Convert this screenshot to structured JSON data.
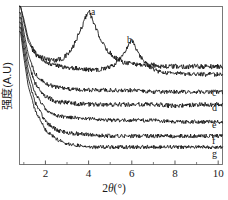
{
  "figure": {
    "background_color": "#ffffff",
    "frame_color": "#4a4a4a",
    "curve_color": "#111111"
  },
  "axes": {
    "x_title_prefix": "2",
    "x_title_symbol": "θ",
    "x_title_suffix": "(°)",
    "y_title": "强度(A.U)",
    "x_ticklabels": [
      "2",
      "4",
      "6",
      "8",
      "10"
    ],
    "x_tickvalues": [
      2,
      4,
      6,
      8,
      10
    ],
    "x_minor_tickvalues": [
      1,
      3,
      5,
      7,
      9
    ],
    "y_ticklabels": []
  },
  "annotations": {
    "peak_a": "a",
    "peak_b": "b"
  },
  "curve_labels": {
    "c": "c",
    "d": "d",
    "e": "e",
    "f": "f",
    "g": "g"
  },
  "chart_data": {
    "type": "line",
    "title": "",
    "xlabel": "2θ(°)",
    "ylabel": "强度(A.U)",
    "xlim": [
      0.8,
      10.2
    ],
    "ylim": [
      0,
      100
    ],
    "grid": false,
    "legend": "inline-right-labels",
    "annotations": [
      {
        "text": "a",
        "x": 4.0,
        "note": "main diffraction peak of curve a"
      },
      {
        "text": "b",
        "x": 6.0,
        "note": "main diffraction peak of curve b"
      }
    ],
    "series": [
      {
        "name": "a",
        "label_position": "peak",
        "baseline": 62,
        "low_angle_rise": true,
        "peaks": [
          {
            "center": 4.0,
            "height": 36,
            "width": 1.15
          }
        ],
        "noise": 1.6,
        "x": [
          0.85,
          1.0,
          1.2,
          1.5,
          1.8,
          2.0,
          2.4,
          2.8,
          3.2,
          3.6,
          4.0,
          4.4,
          4.8,
          5.2,
          5.6,
          6.0,
          6.5,
          7.0,
          7.5,
          8.0,
          8.5,
          9.0,
          9.5,
          10.0
        ],
        "y": [
          100,
          92,
          80,
          71,
          68,
          67,
          66,
          67,
          72,
          84,
          98,
          84,
          73,
          68,
          65,
          64,
          63,
          63,
          62,
          62,
          62,
          62,
          62,
          62
        ]
      },
      {
        "name": "b",
        "label_position": "peak",
        "baseline": 58,
        "low_angle_rise": true,
        "peaks": [
          {
            "center": 6.0,
            "height": 20,
            "width": 0.75
          }
        ],
        "noise": 1.4,
        "x": [
          0.85,
          1.0,
          1.2,
          1.5,
          1.8,
          2.0,
          2.4,
          2.8,
          3.2,
          3.6,
          4.0,
          4.4,
          4.8,
          5.2,
          5.6,
          6.0,
          6.4,
          6.8,
          7.2,
          7.6,
          8.0,
          8.6,
          9.2,
          10.0
        ],
        "y": [
          100,
          90,
          78,
          70,
          67,
          65,
          63,
          62,
          61,
          61,
          60,
          60,
          61,
          63,
          69,
          79,
          68,
          62,
          59,
          58,
          58,
          57,
          57,
          57
        ]
      },
      {
        "name": "c",
        "label_position": "right",
        "baseline": 46,
        "low_angle_rise": true,
        "peaks": [],
        "noise": 1.3,
        "x": [
          0.85,
          1.0,
          1.2,
          1.5,
          2.0,
          2.5,
          3.0,
          4.0,
          5.0,
          6.0,
          7.0,
          8.0,
          9.0,
          10.0
        ],
        "y": [
          96,
          84,
          70,
          58,
          51,
          49,
          48,
          47,
          47,
          47,
          46,
          46,
          46,
          46
        ]
      },
      {
        "name": "d",
        "label_position": "right",
        "baseline": 37,
        "low_angle_rise": true,
        "peaks": [],
        "noise": 1.5,
        "x": [
          0.85,
          1.0,
          1.2,
          1.5,
          2.0,
          2.5,
          3.0,
          4.0,
          5.0,
          6.0,
          7.0,
          8.0,
          9.0,
          10.0
        ],
        "y": [
          93,
          80,
          65,
          52,
          43,
          40,
          39,
          38,
          38,
          38,
          38,
          37,
          38,
          38
        ]
      },
      {
        "name": "e",
        "label_position": "right",
        "baseline": 27,
        "low_angle_rise": true,
        "peaks": [],
        "noise": 1.2,
        "x": [
          0.85,
          1.0,
          1.2,
          1.5,
          2.0,
          2.5,
          3.0,
          4.0,
          5.0,
          6.0,
          7.0,
          8.0,
          9.0,
          10.0
        ],
        "y": [
          90,
          76,
          60,
          46,
          35,
          31,
          30,
          29,
          28,
          28,
          28,
          27,
          27,
          27
        ]
      },
      {
        "name": "f",
        "label_position": "right",
        "baseline": 17,
        "low_angle_rise": true,
        "peaks": [],
        "noise": 1.3,
        "x": [
          0.85,
          1.0,
          1.2,
          1.5,
          2.0,
          2.5,
          3.0,
          4.0,
          5.0,
          6.0,
          7.0,
          8.0,
          9.0,
          10.0
        ],
        "y": [
          87,
          72,
          55,
          40,
          27,
          22,
          20,
          19,
          18,
          18,
          18,
          18,
          18,
          18
        ]
      },
      {
        "name": "g",
        "label_position": "right",
        "baseline": 10,
        "low_angle_rise": true,
        "peaks": [],
        "noise": 1.2,
        "x": [
          0.85,
          1.0,
          1.2,
          1.5,
          2.0,
          2.5,
          3.0,
          4.0,
          5.0,
          6.0,
          7.0,
          8.0,
          9.0,
          10.0
        ],
        "y": [
          84,
          68,
          50,
          35,
          22,
          16,
          13,
          11,
          11,
          11,
          11,
          11,
          11,
          11
        ]
      }
    ]
  }
}
